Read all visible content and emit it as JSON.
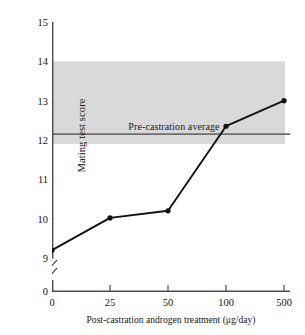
{
  "chart_data": {
    "type": "line",
    "title": "",
    "xlabel": "Post-castration androgen treatment (μg/day)",
    "ylabel": "Mating test score",
    "categories": [
      "0",
      "25",
      "50",
      "100",
      "500"
    ],
    "x": [
      0,
      25,
      50,
      100,
      500
    ],
    "values": [
      9.2,
      10.02,
      10.2,
      12.35,
      13.0
    ],
    "series": [
      {
        "name": "Mating test score",
        "values": [
          9.2,
          10.02,
          10.2,
          12.35,
          13.0
        ],
        "marker": "filled-circle",
        "color": "#111111"
      }
    ],
    "ylim": [
      9,
      15
    ],
    "yticks": [
      9,
      10,
      11,
      12,
      13,
      14,
      15
    ],
    "ytick_labels": [
      "9",
      "10",
      "11",
      "12",
      "13",
      "14",
      "15"
    ],
    "y_axis_break": true,
    "y_axis_origin_label": "0",
    "xtick_labels": [
      "0",
      "25",
      "50",
      "100",
      "500"
    ],
    "x_scale": "categorical",
    "grid": false,
    "legend": "none",
    "bands": [
      {
        "label": "Pre-castration range",
        "y_low": 11.9,
        "y_high": 14.0,
        "color": "#d9d9d9"
      }
    ],
    "reference_lines": [
      {
        "label": "Pre-castration average",
        "y": 12.15,
        "color": "#6e6e6e"
      }
    ],
    "annotations": [
      {
        "text": "Pre-castration average",
        "x_category": "50",
        "y": 12.15
      }
    ]
  },
  "axes": {
    "y_label": "Mating test score",
    "x_label": "Post-castration androgen treatment (μg/day)",
    "y_ticks": [
      "15",
      "14",
      "13",
      "12",
      "11",
      "10",
      "9"
    ],
    "y_origin": "0",
    "x_ticks": [
      "0",
      "25",
      "50",
      "100",
      "500"
    ]
  },
  "annotation": {
    "pre_castration_average": "Pre-castration average"
  },
  "colors": {
    "band": "#d9d9d9",
    "reference_line": "#6e6e6e",
    "data_line": "#111111",
    "axis": "#4d4d4d",
    "text": "#161616",
    "background": "#ffffff"
  }
}
